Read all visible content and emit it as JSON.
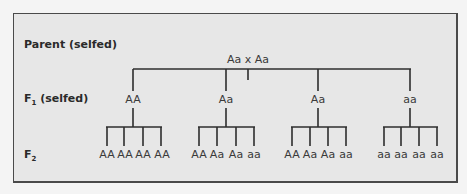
{
  "diagram": {
    "rows": {
      "parent": {
        "label": "Parent (selfed)"
      },
      "f1": {
        "label_main": "F",
        "label_sub": "1",
        "label_suffix": " (selfed)"
      },
      "f2": {
        "label_main": "F",
        "label_sub": "2"
      }
    },
    "parent_cross": "Aa x Aa",
    "f1": [
      {
        "genotype": "AA",
        "f2": [
          "AA",
          "AA",
          "AA",
          "AA"
        ]
      },
      {
        "genotype": "Aa",
        "f2": [
          "AA",
          "Aa",
          "Aa",
          "aa"
        ]
      },
      {
        "genotype": "Aa",
        "f2": [
          "AA",
          "Aa",
          "Aa",
          "aa"
        ]
      },
      {
        "genotype": "aa",
        "f2": [
          "aa",
          "aa",
          "aa",
          "aa"
        ]
      }
    ],
    "colors": {
      "background": "#f4f4f4",
      "panel": "#e7e7e7",
      "border": "#4a4a4a",
      "lines": "#2e2e2e",
      "text": "#3a3a3a"
    }
  }
}
